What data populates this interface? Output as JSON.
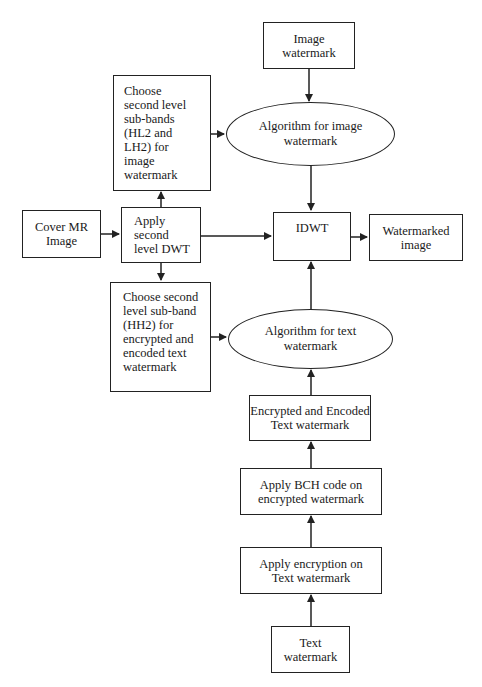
{
  "diagram": {
    "nodes": {
      "image_watermark": {
        "lines": [
          "Image",
          "watermark"
        ]
      },
      "choose_hl2_lh2": {
        "lines": [
          "Choose",
          "second level",
          "sub-bands",
          "(HL2 and",
          "LH2) for",
          "image",
          "watermark"
        ]
      },
      "algo_image": {
        "lines": [
          "Algorithm for image",
          "watermark"
        ]
      },
      "cover_mr": {
        "lines": [
          "Cover MR",
          "Image"
        ]
      },
      "apply_dwt": {
        "lines": [
          "Apply",
          "second",
          "level DWT"
        ]
      },
      "idwt": {
        "lines": [
          "IDWT"
        ]
      },
      "watermarked_image": {
        "lines": [
          "Watermarked",
          "image"
        ]
      },
      "choose_hh2": {
        "lines": [
          "Choose second",
          "level sub-band",
          "(HH2) for",
          "encrypted and",
          "encoded text",
          "watermark"
        ]
      },
      "algo_text": {
        "lines": [
          "Algorithm for text",
          "watermark"
        ]
      },
      "enc_encoded": {
        "lines": [
          "Encrypted and Encoded",
          "Text watermark"
        ]
      },
      "bch": {
        "lines": [
          "Apply BCH code on",
          "encrypted watermark"
        ]
      },
      "encryption": {
        "lines": [
          "Apply encryption on",
          "Text watermark"
        ]
      },
      "text_watermark": {
        "lines": [
          "Text",
          "watermark"
        ]
      }
    },
    "edges": [
      [
        "image_watermark",
        "algo_image"
      ],
      [
        "choose_hl2_lh2",
        "algo_image"
      ],
      [
        "algo_image",
        "idwt"
      ],
      [
        "cover_mr",
        "apply_dwt"
      ],
      [
        "apply_dwt",
        "choose_hl2_lh2"
      ],
      [
        "apply_dwt",
        "idwt"
      ],
      [
        "apply_dwt",
        "choose_hh2"
      ],
      [
        "idwt",
        "watermarked_image"
      ],
      [
        "choose_hh2",
        "algo_text"
      ],
      [
        "algo_text",
        "idwt"
      ],
      [
        "enc_encoded",
        "algo_text"
      ],
      [
        "bch",
        "enc_encoded"
      ],
      [
        "encryption",
        "bch"
      ],
      [
        "text_watermark",
        "encryption"
      ]
    ]
  }
}
